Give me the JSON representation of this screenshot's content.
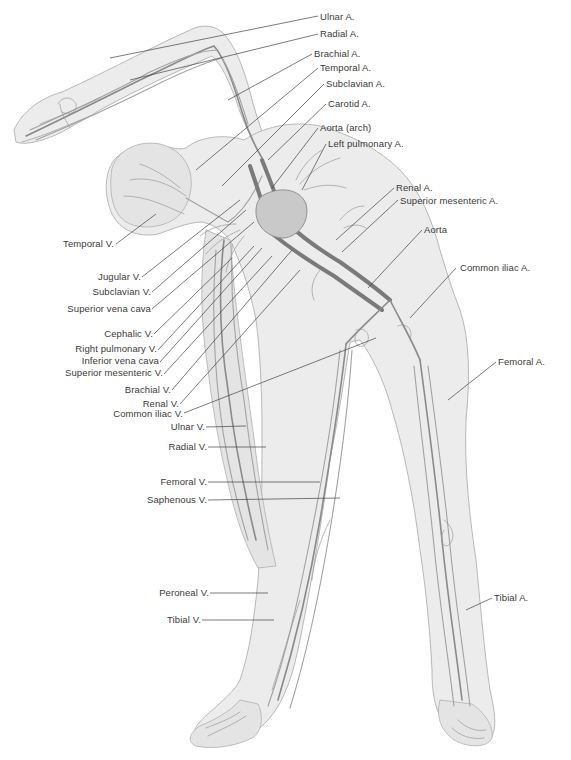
{
  "figure": {
    "colors": {
      "skin": "#ececec",
      "vessel": "#8a8a8a",
      "label_text": "#3a3a3a",
      "leader_line": "#444444",
      "background": "#ffffff"
    }
  },
  "labels": {
    "right": [
      {
        "id": "ulnar-a",
        "text": "Ulnar A."
      },
      {
        "id": "radial-a",
        "text": "Radial A."
      },
      {
        "id": "brachial-a",
        "text": "Brachial A."
      },
      {
        "id": "temporal-a",
        "text": "Temporal A."
      },
      {
        "id": "subclavian-a",
        "text": "Subclavian A."
      },
      {
        "id": "carotid-a",
        "text": "Carotid A."
      },
      {
        "id": "aorta-arch",
        "text": "Aorta (arch)"
      },
      {
        "id": "left-pulmonary-a",
        "text": "Left pulmonary A."
      },
      {
        "id": "renal-a",
        "text": "Renal A."
      },
      {
        "id": "superior-mesenteric-a",
        "text": "Superior mesenteric A."
      },
      {
        "id": "aorta",
        "text": "Aorta"
      },
      {
        "id": "common-iliac-a",
        "text": "Common iliac A."
      },
      {
        "id": "femoral-a",
        "text": "Femoral A."
      },
      {
        "id": "tibial-a",
        "text": "Tibial A."
      }
    ],
    "left": [
      {
        "id": "temporal-v",
        "text": "Temporal V."
      },
      {
        "id": "jugular-v",
        "text": "Jugular V."
      },
      {
        "id": "subclavian-v",
        "text": "Subclavian V."
      },
      {
        "id": "superior-vena-cava",
        "text": "Superior vena cava"
      },
      {
        "id": "cephalic-v",
        "text": "Cephalic V."
      },
      {
        "id": "right-pulmonary-v",
        "text": "Right pulmonary V."
      },
      {
        "id": "inferior-vena-cava",
        "text": "Inferior vena cava"
      },
      {
        "id": "superior-mesenteric-v",
        "text": "Superior mesenteric V."
      },
      {
        "id": "brachial-v",
        "text": "Brachial V."
      },
      {
        "id": "renal-v",
        "text": "Renal V."
      },
      {
        "id": "common-iliac-v",
        "text": "Common iliac V."
      },
      {
        "id": "ulnar-v",
        "text": "Ulnar V."
      },
      {
        "id": "radial-v",
        "text": "Radial V."
      },
      {
        "id": "femoral-v",
        "text": "Femoral V."
      },
      {
        "id": "saphenous-v",
        "text": "Saphenous V."
      },
      {
        "id": "peroneal-v",
        "text": "Peroneal V."
      },
      {
        "id": "tibial-v",
        "text": "Tibial V."
      }
    ]
  }
}
